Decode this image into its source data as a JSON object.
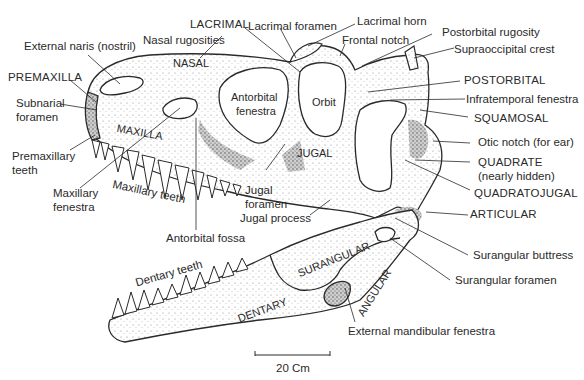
{
  "figure": {
    "labels": {
      "external_naris": "External naris (nostril)",
      "premaxilla": "PREMAXILLA",
      "subnarial_foramen_1": "Subnarial",
      "subnarial_foramen_2": "foramen",
      "premaxillary_teeth_1": "Premaxillary",
      "premaxillary_teeth_2": "teeth",
      "maxillary_fenestra_1": "Maxillary",
      "maxillary_fenestra_2": "fenestra",
      "maxillary_teeth": "Maxillary teeth",
      "antorbital_fossa": "Antorbital fossa",
      "nasal_rugosities": "Nasal rugosities",
      "lacrimal": "LACRIMAL",
      "lacrimal_foramen": "Lacrimal foramen",
      "lacrimal_horn": "Lacrimal horn",
      "frontal_notch": "Frontal notch",
      "postorbital_rugosity": "Postorbital rugosity",
      "supraoccipital_crest": "Supraoccipital crest",
      "postorbital": "POSTORBITAL",
      "infratemporal_fenestra": "Infratemporal fenestra",
      "squamosal": "SQUAMOSAL",
      "otic_notch": "Otic notch (for ear)",
      "quadrate_1": "QUADRATE",
      "quadrate_2": "(nearly hidden)",
      "quadratojugal": "QUADRATOJUGAL",
      "articular": "ARTICULAR",
      "surangular_buttress": "Surangular buttress",
      "surangular_foramen": "Surangular foramen",
      "external_mandibular_fenestra": "External mandibular fenestra",
      "jugal_foramen_1": "Jugal",
      "jugal_foramen_2": "foramen",
      "jugal_process": "Jugal process",
      "dentary_teeth": "Dentary teeth"
    },
    "bone_labels": {
      "nasal": "NASAL",
      "maxilla": "MAXILLA",
      "antorbital_fenestra_1": "Antorbital",
      "antorbital_fenestra_2": "fenestra",
      "orbit": "Orbit",
      "jugal": "JUGAL",
      "surangular": "SURANGULAR",
      "angular": "ANGULAR",
      "dentary": "DENTARY"
    },
    "scale_bar": {
      "label": "20 Cm"
    },
    "colors": {
      "ink": "#2a2a2a",
      "bone_fill": "#f4f4f4",
      "shade": "#555555",
      "background": "#ffffff"
    }
  }
}
